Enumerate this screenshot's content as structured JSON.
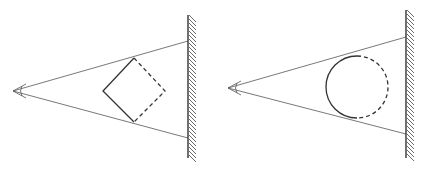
{
  "diagram": {
    "panels": [
      {
        "name": "square-panel",
        "eye": {
          "x": 13,
          "y": 91
        },
        "wall": {
          "x": 188,
          "y1": 15,
          "y2": 158
        },
        "ray_hits": [
          41,
          138
        ],
        "object": {
          "type": "square",
          "top": [
            134,
            58
          ],
          "left": [
            103,
            91
          ],
          "bottom": [
            134,
            122
          ],
          "right": [
            165,
            91
          ]
        }
      },
      {
        "name": "circle-panel",
        "eye": {
          "x": 228,
          "y": 88
        },
        "wall": {
          "x": 406,
          "y1": 10,
          "y2": 158
        },
        "ray_hits": [
          37,
          134
        ],
        "object": {
          "type": "circle",
          "cx": 357,
          "cy": 87,
          "r": 31
        }
      }
    ],
    "colors": {
      "line": "#333333",
      "ray": "#555555",
      "background": "#ffffff"
    }
  }
}
